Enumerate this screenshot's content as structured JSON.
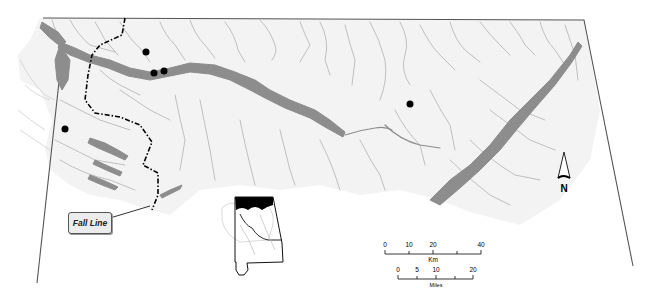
{
  "map": {
    "title": "",
    "region": "North Alabama watershed",
    "colors": {
      "background": "#ffffff",
      "basin_fill": "#f3f3f3",
      "streams": "#b9b9b9",
      "main_river": "#8d8d8d",
      "frame": "#555555",
      "fall_line": "#000000",
      "sites": "#000000",
      "inset_highlight": "#000000"
    },
    "fall_line_label": "Fall Line",
    "north_arrow": {
      "label": "N"
    },
    "scale_bar": {
      "km": {
        "unit_label": "Km",
        "ticks": [
          "0",
          "10",
          "20",
          "40"
        ]
      },
      "miles": {
        "unit_label": "Miles",
        "ticks": [
          "0",
          "5",
          "10",
          "20"
        ]
      }
    },
    "sites": [
      {
        "x": 146,
        "y": 52
      },
      {
        "x": 154,
        "y": 73
      },
      {
        "x": 164,
        "y": 71
      },
      {
        "x": 65,
        "y": 129
      },
      {
        "x": 410,
        "y": 104
      }
    ],
    "inset": {
      "name": "Alabama state locator",
      "highlight": "northern Alabama"
    }
  }
}
